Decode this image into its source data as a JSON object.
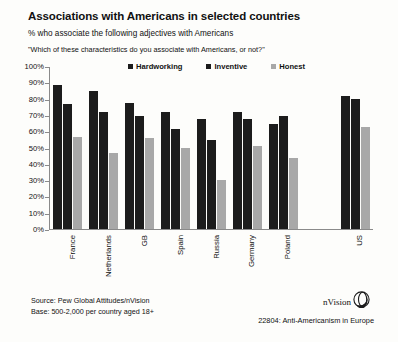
{
  "header": {
    "title": "Associations with Americans in selected countries",
    "subtitle": "% who associate the following adjectives with Americans",
    "question": "\"Which of these characteristics do you associate with Americans, or not?\""
  },
  "footer": {
    "source": "Source: Pew Global Attitudes/nVision",
    "base": "Base: 500-2,000 per country aged 18+",
    "brand": "nVision",
    "brand_icon": "nvision-ring-logo",
    "caption": "22804: Anti-Americanism in Europe"
  },
  "colors": {
    "dark_bar": "#1c1c1c",
    "light_bar": "#a8a8a8",
    "axis": "#8a8a8a",
    "background": "#fdfdfb",
    "text": "#111111"
  },
  "chart_data": {
    "type": "bar",
    "title": "Associations with Americans in selected countries",
    "subtitle": "% who associate the following adjectives with Americans",
    "xlabel": "",
    "ylabel": "",
    "ylim": [
      0,
      100
    ],
    "yticks": [
      "0%",
      "10%",
      "20%",
      "30%",
      "40%",
      "50%",
      "60%",
      "70%",
      "80%",
      "90%",
      "100%"
    ],
    "grid": false,
    "legend_position": "top-center",
    "categories": [
      "France",
      "Netherlands",
      "GB",
      "Spain",
      "Russia",
      "Germany",
      "Poland",
      "",
      "US"
    ],
    "series": [
      {
        "name": "Hardworking",
        "color": "#1c1c1c",
        "values": [
          89,
          85,
          78,
          72,
          68,
          72,
          65,
          null,
          82
        ]
      },
      {
        "name": "Inventive",
        "color": "#1c1c1c",
        "values": [
          77,
          72,
          70,
          62,
          55,
          68,
          70,
          null,
          80
        ]
      },
      {
        "name": "Honest",
        "color": "#a8a8a8",
        "values": [
          57,
          47,
          56,
          50,
          30,
          51,
          44,
          null,
          63
        ]
      }
    ]
  }
}
